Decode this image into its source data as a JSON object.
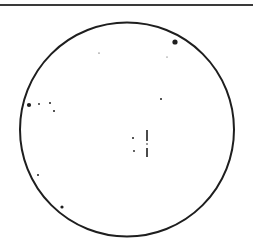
{
  "figure": {
    "type": "eyepiece-field-of-view-star-chart",
    "colors": {
      "ink": "#1e1e1e",
      "background": "#ffffff",
      "rule": "#3a3a3a"
    },
    "field_circle": {
      "cx": 127,
      "cy": 129.5,
      "r": 107,
      "stroke_width": 2
    },
    "stars": [
      {
        "x": 175,
        "y": 42,
        "r": 2.6
      },
      {
        "x": 99,
        "y": 53,
        "r": 0.6
      },
      {
        "x": 167,
        "y": 57,
        "r": 0.5
      },
      {
        "x": 161,
        "y": 99,
        "r": 1.0
      },
      {
        "x": 29,
        "y": 105,
        "r": 2.1
      },
      {
        "x": 39,
        "y": 104,
        "r": 0.9
      },
      {
        "x": 50,
        "y": 103,
        "r": 1.0
      },
      {
        "x": 54,
        "y": 111,
        "r": 1.0
      },
      {
        "x": 133,
        "y": 138,
        "r": 1.0
      },
      {
        "x": 134,
        "y": 151,
        "r": 0.9
      },
      {
        "x": 147,
        "y": 144,
        "r": 0.8
      },
      {
        "x": 38,
        "y": 175,
        "r": 1.0
      },
      {
        "x": 62,
        "y": 207,
        "r": 1.6
      }
    ],
    "markers": [
      {
        "x": 147,
        "y1": 130,
        "y2": 141,
        "width": 1.6
      },
      {
        "x": 147,
        "y1": 148,
        "y2": 157,
        "width": 1.6
      }
    ]
  }
}
